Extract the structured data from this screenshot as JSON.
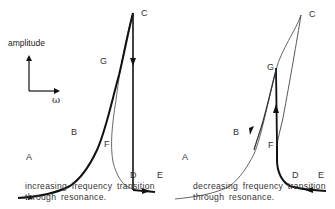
{
  "axes_key": {
    "y_label": "amplitude",
    "x_label": "ω"
  },
  "panels": [
    {
      "id": "increasing",
      "caption_line1": "increasing frequency transition",
      "caption_line2": "through resonance.",
      "points": {
        "A": "A",
        "B": "B",
        "C": "C",
        "D": "D",
        "E": "E",
        "F": "F",
        "G": "G"
      },
      "path_order": [
        "A",
        "B",
        "G",
        "C",
        "D",
        "E"
      ],
      "jump": "C→D (down)"
    },
    {
      "id": "decreasing",
      "caption_line1": "decreasing frequency transition",
      "caption_line2": "through resonance.",
      "points": {
        "A": "A",
        "B": "B",
        "C": "C",
        "D": "D",
        "E": "E",
        "F": "F",
        "G": "G"
      },
      "path_order": [
        "E",
        "D",
        "F",
        "G",
        "B",
        "A"
      ],
      "jump": "F→G (up)"
    }
  ],
  "colors": {
    "bold_path": "#111111",
    "thin_path": "#555555",
    "text": "#333333"
  }
}
